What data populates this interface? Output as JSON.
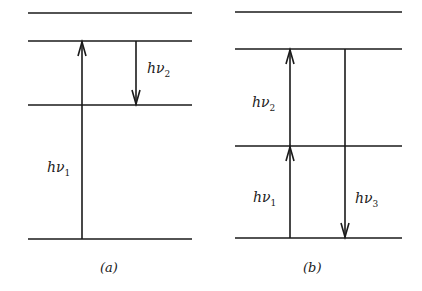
{
  "diagram": {
    "type": "energy-level-diagram",
    "line_color": "#1a1a1a",
    "panels": [
      {
        "id": "a",
        "caption": "(a)",
        "levels_y": [
          13,
          41,
          105,
          239
        ],
        "x_range": [
          28,
          192
        ],
        "transitions": [
          {
            "label": "hν",
            "subscript": "1",
            "direction": "up",
            "from_level": 3,
            "to_level": 1,
            "x": 82
          },
          {
            "label": "hν",
            "subscript": "2",
            "direction": "down",
            "from_level": 1,
            "to_level": 2,
            "x": 136
          }
        ]
      },
      {
        "id": "b",
        "caption": "(b)",
        "levels_y": [
          12,
          49,
          146,
          238
        ],
        "x_range": [
          235,
          402
        ],
        "transitions": [
          {
            "label": "hν",
            "subscript": "1",
            "direction": "up",
            "from_level": 3,
            "to_level": 2,
            "x": 290
          },
          {
            "label": "hν",
            "subscript": "2",
            "direction": "up",
            "from_level": 2,
            "to_level": 1,
            "x": 290
          },
          {
            "label": "hν",
            "subscript": "3",
            "direction": "down",
            "from_level": 1,
            "to_level": 3,
            "x": 345
          }
        ]
      }
    ]
  }
}
